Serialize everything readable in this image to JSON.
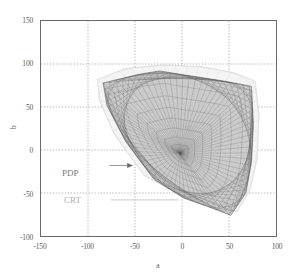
{
  "chart_data": {
    "type": "line",
    "title": "",
    "subtitle": "",
    "xlabel": "a",
    "ylabel": "b",
    "xlim": [
      -150,
      100
    ],
    "ylim": [
      -100,
      150
    ],
    "xticks": [
      -150,
      -100,
      -50,
      0,
      50,
      100
    ],
    "yticks": [
      -100,
      -50,
      0,
      50,
      100,
      150
    ],
    "xtick_labels": [
      "-150",
      "-100",
      "-50",
      "0",
      "50",
      "100"
    ],
    "ytick_labels": [
      "-100",
      "-50",
      "0",
      "50",
      "100",
      "150"
    ],
    "grid": true,
    "grid_style": "dotted",
    "legend": "none",
    "annotations": [
      {
        "text": "PDP",
        "label_x": -94,
        "label_y": -18,
        "arrow_to_x": -52,
        "arrow_to_y": -18,
        "style": "arrow",
        "color": "#7a7a7a"
      },
      {
        "text": "CRT",
        "label_x": -93,
        "label_y": -58,
        "arrow_to_x": -4,
        "arrow_to_y": -58,
        "style": "line",
        "color": "#b0b0b0"
      }
    ],
    "series": [
      {
        "name": "CRT",
        "kind": "gamut-outline",
        "color": "#cfcfcf",
        "outline": [
          [
            -90,
            82
          ],
          [
            -60,
            95
          ],
          [
            -20,
            99
          ],
          [
            20,
            97
          ],
          [
            55,
            90
          ],
          [
            78,
            80
          ],
          [
            82,
            40
          ],
          [
            80,
            -10
          ],
          [
            72,
            -48
          ],
          [
            58,
            -72
          ],
          [
            30,
            -62
          ],
          [
            -2,
            -52
          ],
          [
            -40,
            -30
          ],
          [
            -72,
            18
          ],
          [
            -88,
            58
          ]
        ]
      },
      {
        "name": "PDP",
        "kind": "gamut-mesh",
        "color": "#8a8a8a",
        "outline": [
          [
            -84,
            78
          ],
          [
            -46,
            88
          ],
          [
            -24,
            92
          ],
          [
            10,
            86
          ],
          [
            46,
            80
          ],
          [
            74,
            74
          ],
          [
            76,
            30
          ],
          [
            74,
            -14
          ],
          [
            68,
            -50
          ],
          [
            52,
            -76
          ],
          [
            28,
            -66
          ],
          [
            2,
            -56
          ],
          [
            -30,
            -34
          ],
          [
            -60,
            10
          ],
          [
            -80,
            52
          ]
        ],
        "convergence_point": [
          -2,
          -4
        ]
      }
    ]
  },
  "axes": {
    "x_title": "a",
    "y_title": "b"
  }
}
